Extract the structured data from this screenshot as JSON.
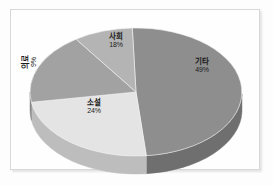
{
  "chart_data": {
    "type": "pie",
    "title": "",
    "subtitle": "",
    "xlabel": "",
    "ylabel": "",
    "legend_position": "none",
    "grid": false,
    "three_d": true,
    "categories": [
      "기타",
      "소설",
      "사회",
      "의료"
    ],
    "values": [
      49,
      24,
      18,
      9
    ],
    "labels_format": "percent",
    "slices": [
      {
        "name": "기타",
        "percent": 49,
        "percent_label": "49%",
        "color": "#8e8e8e",
        "side_color": "#6f6f6f"
      },
      {
        "name": "소설",
        "percent": 24,
        "percent_label": "24%",
        "color": "#e4e4e4",
        "side_color": "#bdbdbd"
      },
      {
        "name": "사회",
        "percent": 18,
        "percent_label": "18%",
        "color": "#a2a2a2",
        "side_color": "#868686"
      },
      {
        "name": "의료",
        "percent": 9,
        "percent_label": "9%",
        "color": "#b4b4b4",
        "side_color": "#9a9a9a"
      }
    ]
  },
  "figure": {
    "background_color": "#fdfdfd",
    "frame_color": "#d8d8d8",
    "label_text_color": "#1b1b1b"
  }
}
